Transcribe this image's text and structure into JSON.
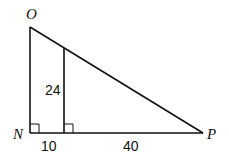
{
  "diagram": {
    "type": "geometry-right-triangle",
    "vertices": [
      {
        "id": "O",
        "label": "O"
      },
      {
        "id": "N",
        "label": "N"
      },
      {
        "id": "P",
        "label": "P"
      }
    ],
    "measurements": {
      "inner_segment": "24",
      "left_base": "10",
      "right_base": "40"
    },
    "right_angle_markers": 2,
    "colors": {
      "stroke": "#111111",
      "background": "#ffffff"
    }
  }
}
